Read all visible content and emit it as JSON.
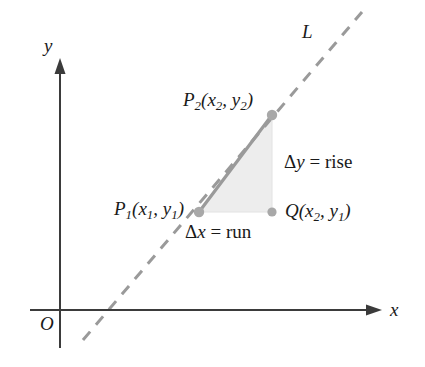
{
  "figure": {
    "colors": {
      "axis": "#3b3b3b",
      "dashed_line": "#9a9a9a",
      "segment": "#9a9a9a",
      "triangle_fill": "#ededed",
      "point_dot": "#a8a8a8",
      "text": "#1a1a1a"
    }
  },
  "axes": {
    "y_label": "y",
    "x_label": "x",
    "origin_label": "O"
  },
  "line": {
    "label": "L",
    "style": "dashed"
  },
  "points": {
    "p1": {
      "name": "P",
      "sub": "1",
      "coords_open": "(",
      "x_var": "x",
      "x_sub": "1",
      "comma": ", ",
      "y_var": "y",
      "y_sub": "1",
      "coords_close": ")"
    },
    "p2": {
      "name": "P",
      "sub": "2",
      "coords_open": "(",
      "x_var": "x",
      "x_sub": "2",
      "comma": ", ",
      "y_var": "y",
      "y_sub": "2",
      "coords_close": ")"
    },
    "q": {
      "name": "Q",
      "sub": "",
      "coords_open": "(",
      "x_var": "x",
      "x_sub": "2",
      "comma": ", ",
      "y_var": "y",
      "y_sub": "1",
      "coords_close": ")"
    }
  },
  "annotations": {
    "rise": {
      "delta": "Δ",
      "var": "y",
      "equals": " = ",
      "word": "rise"
    },
    "run": {
      "delta": "Δ",
      "var": "x",
      "equals": " = ",
      "word": "run"
    }
  },
  "geometry": {
    "y_axis_x": 60,
    "x_axis_y": 310,
    "p1": [
      199,
      212
    ],
    "p2": [
      272,
      115
    ],
    "q": [
      272,
      212
    ],
    "dash_start": [
      83,
      340
    ],
    "dash_end": [
      362,
      12
    ]
  }
}
